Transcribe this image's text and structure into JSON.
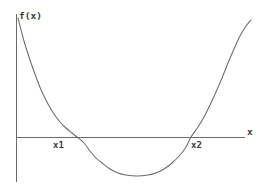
{
  "figure": {
    "background_color": "#ffffff",
    "stroke_color": "#6b6b6b",
    "text_color": "#3a3a3a",
    "width": 267,
    "height": 192
  },
  "labels": {
    "y_axis": "f(x)",
    "x_axis": "x",
    "root1": "x1",
    "root2": "x2"
  },
  "chart_data": {
    "type": "line",
    "title": "",
    "subtitle": "",
    "xlabel": "x",
    "ylabel": "f(x)",
    "grid": false,
    "legend": null,
    "axes": {
      "x_axis": {
        "label": "x",
        "drawn_from_px": [
          16,
          137
        ],
        "drawn_to_px": [
          245,
          137
        ],
        "arrow": false,
        "ticks": [],
        "tick_labels": []
      },
      "y_axis": {
        "label": "f(x)",
        "drawn_from_px": [
          16,
          14
        ],
        "drawn_to_px": [
          16,
          182
        ],
        "arrow": false,
        "ticks": [],
        "tick_labels": []
      }
    },
    "series": [
      {
        "name": "f(x)",
        "shape": "parabola",
        "description": "upward-opening quadratic crossing the x-axis at x1 and x2",
        "points_px": [
          [
            18,
            18
          ],
          [
            24,
            41
          ],
          [
            30,
            60
          ],
          [
            36,
            77
          ],
          [
            42,
            92
          ],
          [
            48,
            104
          ],
          [
            54,
            114
          ],
          [
            60,
            122
          ],
          [
            66,
            128
          ],
          [
            72,
            133
          ],
          [
            77,
            137
          ],
          [
            84,
            143
          ],
          [
            90,
            151
          ],
          [
            96,
            158
          ],
          [
            102,
            163
          ],
          [
            110,
            169
          ],
          [
            118,
            173
          ],
          [
            126,
            175
          ],
          [
            137,
            176
          ],
          [
            148,
            175
          ],
          [
            156,
            173
          ],
          [
            164,
            169
          ],
          [
            172,
            163
          ],
          [
            180,
            155
          ],
          [
            186,
            147
          ],
          [
            191,
            137
          ],
          [
            198,
            127
          ],
          [
            204,
            117
          ],
          [
            210,
            105
          ],
          [
            216,
            92
          ],
          [
            222,
            78
          ],
          [
            228,
            63
          ],
          [
            234,
            49
          ],
          [
            240,
            36
          ],
          [
            246,
            26
          ],
          [
            251,
            20
          ]
        ],
        "roots": [
          {
            "label": "x1",
            "x_px": 77
          },
          {
            "label": "x2",
            "x_px": 191
          }
        ],
        "vertex_px": [
          137,
          176
        ]
      }
    ],
    "annotations": [
      {
        "text": "f(x)",
        "x_px": 19,
        "y_px": 11,
        "role": "y-axis-label"
      },
      {
        "text": "x",
        "x_px": 247,
        "y_px": 127,
        "role": "x-axis-label"
      },
      {
        "text": "x1",
        "x_px": 53,
        "y_px": 141,
        "role": "root-label"
      },
      {
        "text": "x2",
        "x_px": 191,
        "y_px": 141,
        "role": "root-label"
      }
    ]
  }
}
